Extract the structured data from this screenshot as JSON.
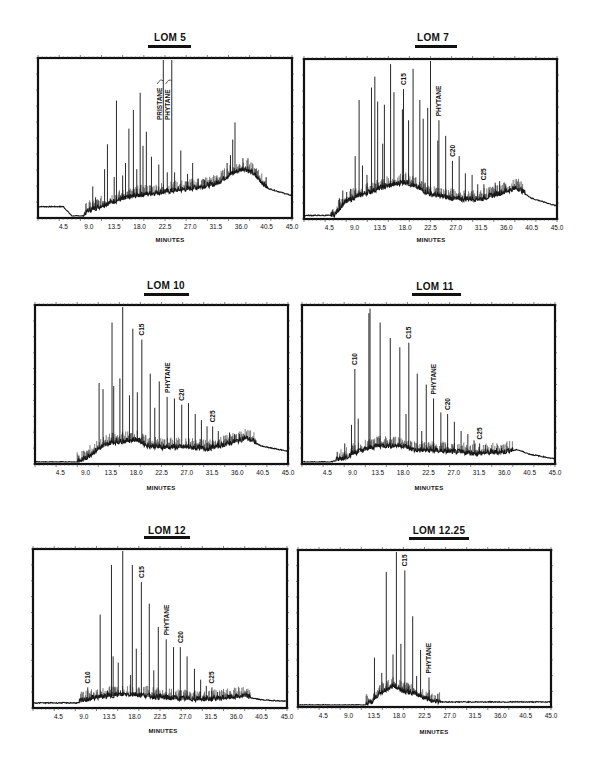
{
  "chart_data": [
    {
      "type": "line",
      "title": "LOM 5",
      "xlabel": "MINUTES",
      "ylabel": "",
      "xlim": [
        0,
        45.0
      ],
      "x_ticks": [
        "4.5",
        "9.0",
        "13.5",
        "18.0",
        "22.5",
        "27.0",
        "31.5",
        "36.0",
        "40.5",
        "45.0"
      ],
      "annotations": [
        "PRISTANE",
        "PHYTANE"
      ],
      "baseline": [
        [
          0,
          0.06
        ],
        [
          4.5,
          0.06
        ],
        [
          6,
          0.0
        ],
        [
          8,
          0.0
        ],
        [
          9,
          0.03
        ],
        [
          13.5,
          0.09
        ],
        [
          18,
          0.13
        ],
        [
          22.5,
          0.15
        ],
        [
          27,
          0.17
        ],
        [
          31.5,
          0.2
        ],
        [
          34,
          0.26
        ],
        [
          36.5,
          0.3
        ],
        [
          38,
          0.27
        ],
        [
          40.5,
          0.18
        ],
        [
          45,
          0.13
        ]
      ],
      "peaks": [
        {
          "x": 9.7,
          "h": 0.19
        },
        {
          "x": 10.2,
          "h": 0.12
        },
        {
          "x": 11.8,
          "h": 0.3
        },
        {
          "x": 12.3,
          "h": 0.46
        },
        {
          "x": 13.5,
          "h": 0.25
        },
        {
          "x": 13.9,
          "h": 0.74
        },
        {
          "x": 15.0,
          "h": 0.26
        },
        {
          "x": 15.5,
          "h": 0.34
        },
        {
          "x": 16.1,
          "h": 0.56
        },
        {
          "x": 16.9,
          "h": 0.68
        },
        {
          "x": 17.5,
          "h": 0.3
        },
        {
          "x": 18.1,
          "h": 0.79
        },
        {
          "x": 18.6,
          "h": 0.45
        },
        {
          "x": 19.2,
          "h": 0.54
        },
        {
          "x": 20.1,
          "h": 0.38
        },
        {
          "x": 21.4,
          "h": 0.33
        },
        {
          "x": 22.2,
          "h": 1.0,
          "label": "PRISTANE"
        },
        {
          "x": 22.9,
          "h": 0.28
        },
        {
          "x": 23.7,
          "h": 1.0,
          "label": "PHYTANE"
        },
        {
          "x": 24.2,
          "h": 0.28
        },
        {
          "x": 25.3,
          "h": 0.42
        },
        {
          "x": 26.5,
          "h": 0.27
        },
        {
          "x": 27.4,
          "h": 0.34
        },
        {
          "x": 28.4,
          "h": 0.24
        },
        {
          "x": 29.5,
          "h": 0.23
        },
        {
          "x": 30.5,
          "h": 0.23
        },
        {
          "x": 31.7,
          "h": 0.26
        },
        {
          "x": 33.5,
          "h": 0.34
        },
        {
          "x": 34.1,
          "h": 0.39
        },
        {
          "x": 34.5,
          "h": 0.49
        },
        {
          "x": 34.9,
          "h": 0.6
        },
        {
          "x": 36.3,
          "h": 0.37
        },
        {
          "x": 37.2,
          "h": 0.37
        },
        {
          "x": 38.6,
          "h": 0.3
        }
      ]
    },
    {
      "type": "line",
      "title": "LOM 7",
      "xlabel": "MINUTES",
      "ylabel": "",
      "xlim": [
        0,
        45.0
      ],
      "x_ticks": [
        "4.5",
        "9.0",
        "13.5",
        "18.0",
        "22.5",
        "27.0",
        "31.5",
        "36.0",
        "40.5",
        "45.0"
      ],
      "annotations": [
        "C15",
        "PHYTANE",
        "C20",
        "C25"
      ],
      "baseline": [
        [
          0,
          0.01
        ],
        [
          5.5,
          0.01
        ],
        [
          7,
          0.08
        ],
        [
          9,
          0.12
        ],
        [
          13.5,
          0.18
        ],
        [
          18,
          0.22
        ],
        [
          22.5,
          0.14
        ],
        [
          27,
          0.11
        ],
        [
          31.5,
          0.11
        ],
        [
          36,
          0.16
        ],
        [
          38,
          0.18
        ],
        [
          40.5,
          0.12
        ],
        [
          45,
          0.07
        ]
      ],
      "peaks": [
        {
          "x": 6.3,
          "h": 0.12
        },
        {
          "x": 6.9,
          "h": 0.17
        },
        {
          "x": 7.6,
          "h": 0.16
        },
        {
          "x": 8.3,
          "h": 0.18
        },
        {
          "x": 9.1,
          "h": 0.39
        },
        {
          "x": 9.8,
          "h": 0.75
        },
        {
          "x": 10.4,
          "h": 0.33
        },
        {
          "x": 11.2,
          "h": 0.27
        },
        {
          "x": 12.0,
          "h": 0.83
        },
        {
          "x": 12.6,
          "h": 0.9
        },
        {
          "x": 13.1,
          "h": 0.74
        },
        {
          "x": 14.0,
          "h": 0.47
        },
        {
          "x": 14.3,
          "h": 0.72
        },
        {
          "x": 15.4,
          "h": 0.98
        },
        {
          "x": 16.0,
          "h": 0.8
        },
        {
          "x": 17.5,
          "h": 0.69
        },
        {
          "x": 17.7,
          "h": 0.82,
          "label": "C15"
        },
        {
          "x": 18.6,
          "h": 0.62
        },
        {
          "x": 19.4,
          "h": 0.95
        },
        {
          "x": 20.6,
          "h": 0.75
        },
        {
          "x": 21.2,
          "h": 0.63
        },
        {
          "x": 22.0,
          "h": 0.7
        },
        {
          "x": 22.5,
          "h": 1.0
        },
        {
          "x": 23.8,
          "h": 0.49
        },
        {
          "x": 24.0,
          "h": 0.62,
          "label": "PHYTANE"
        },
        {
          "x": 25.2,
          "h": 0.52
        },
        {
          "x": 26.4,
          "h": 0.36,
          "label": "C20"
        },
        {
          "x": 27.6,
          "h": 0.39
        },
        {
          "x": 28.7,
          "h": 0.28
        },
        {
          "x": 29.9,
          "h": 0.27
        },
        {
          "x": 30.9,
          "h": 0.21
        },
        {
          "x": 32.0,
          "h": 0.21,
          "label": "C25"
        },
        {
          "x": 32.9,
          "h": 0.19
        },
        {
          "x": 34.0,
          "h": 0.22
        },
        {
          "x": 34.8,
          "h": 0.23
        },
        {
          "x": 35.9,
          "h": 0.2
        },
        {
          "x": 36.6,
          "h": 0.2
        },
        {
          "x": 37.3,
          "h": 0.2
        }
      ]
    },
    {
      "type": "line",
      "title": "LOM 10",
      "xlabel": "MINUTES",
      "ylabel": "",
      "xlim": [
        0,
        45.0
      ],
      "x_ticks": [
        "4.5",
        "9.0",
        "13.5",
        "18.0",
        "22.5",
        "27.0",
        "31.5",
        "36.0",
        "40.5",
        "45.0"
      ],
      "annotations": [
        "C15",
        "PHYTANE",
        "C20",
        "C25"
      ],
      "baseline": [
        [
          0,
          0.0
        ],
        [
          8,
          0.0
        ],
        [
          9,
          0.02
        ],
        [
          11.3,
          0.08
        ],
        [
          13.5,
          0.12
        ],
        [
          16,
          0.13
        ],
        [
          18,
          0.14
        ],
        [
          20,
          0.1
        ],
        [
          22.5,
          0.09
        ],
        [
          27,
          0.09
        ],
        [
          30.5,
          0.08
        ],
        [
          33,
          0.1
        ],
        [
          36,
          0.13
        ],
        [
          37.5,
          0.15
        ],
        [
          40.5,
          0.1
        ],
        [
          45,
          0.07
        ]
      ],
      "peaks": [
        {
          "x": 9.0,
          "h": 0.04
        },
        {
          "x": 9.5,
          "h": 0.05
        },
        {
          "x": 10.0,
          "h": 0.06
        },
        {
          "x": 10.8,
          "h": 0.07
        },
        {
          "x": 11.4,
          "h": 0.51
        },
        {
          "x": 12.1,
          "h": 0.47
        },
        {
          "x": 13.7,
          "h": 0.9
        },
        {
          "x": 14.0,
          "h": 0.49
        },
        {
          "x": 15.1,
          "h": 0.54
        },
        {
          "x": 15.6,
          "h": 1.0
        },
        {
          "x": 16.8,
          "h": 0.43
        },
        {
          "x": 17.4,
          "h": 0.86
        },
        {
          "x": 18.2,
          "h": 0.45
        },
        {
          "x": 19.0,
          "h": 0.79,
          "label": "C15"
        },
        {
          "x": 20.5,
          "h": 0.57
        },
        {
          "x": 21.3,
          "h": 0.35
        },
        {
          "x": 22.1,
          "h": 0.52
        },
        {
          "x": 23.5,
          "h": 0.42,
          "label": "PHYTANE"
        },
        {
          "x": 24.8,
          "h": 0.41
        },
        {
          "x": 26.1,
          "h": 0.37,
          "label": "C20"
        },
        {
          "x": 27.3,
          "h": 0.38
        },
        {
          "x": 28.5,
          "h": 0.31
        },
        {
          "x": 29.6,
          "h": 0.27
        },
        {
          "x": 30.6,
          "h": 0.23
        },
        {
          "x": 31.6,
          "h": 0.23,
          "label": "C25"
        },
        {
          "x": 32.6,
          "h": 0.2
        },
        {
          "x": 33.6,
          "h": 0.17
        },
        {
          "x": 34.6,
          "h": 0.19
        },
        {
          "x": 35.5,
          "h": 0.18
        },
        {
          "x": 36.4,
          "h": 0.18
        },
        {
          "x": 37.3,
          "h": 0.17
        }
      ]
    },
    {
      "type": "line",
      "title": "LOM 11",
      "xlabel": "MINUTES",
      "ylabel": "",
      "xlim": [
        0,
        45.0
      ],
      "x_ticks": [
        "4.5",
        "9.0",
        "13.5",
        "18.0",
        "22.5",
        "27.0",
        "31.5",
        "36.0",
        "40.5",
        "45.0"
      ],
      "annotations": [
        "C10",
        "PHYTANE",
        "C20",
        "C25"
      ],
      "labels_extra": [
        "C15"
      ],
      "baseline": [
        [
          0,
          0.0
        ],
        [
          5,
          0.0
        ],
        [
          7.5,
          0.02
        ],
        [
          9,
          0.05
        ],
        [
          13.5,
          0.1
        ],
        [
          18,
          0.1
        ],
        [
          20,
          0.07
        ],
        [
          22.5,
          0.07
        ],
        [
          27,
          0.06
        ],
        [
          31.5,
          0.05
        ],
        [
          36,
          0.06
        ],
        [
          38.3,
          0.08
        ],
        [
          40.5,
          0.05
        ],
        [
          45,
          0.02
        ]
      ],
      "peaks": [
        {
          "x": 7.6,
          "h": 0.12
        },
        {
          "x": 8.8,
          "h": 0.24
        },
        {
          "x": 9.4,
          "h": 0.6,
          "label": "C10"
        },
        {
          "x": 10.0,
          "h": 0.28
        },
        {
          "x": 11.9,
          "h": 0.96
        },
        {
          "x": 12.1,
          "h": 0.99
        },
        {
          "x": 13.9,
          "h": 0.9
        },
        {
          "x": 15.7,
          "h": 0.8
        },
        {
          "x": 17.4,
          "h": 0.74
        },
        {
          "x": 19.0,
          "h": 0.77,
          "label": "C15"
        },
        {
          "x": 18.5,
          "h": 0.31
        },
        {
          "x": 20.5,
          "h": 0.57
        },
        {
          "x": 21.3,
          "h": 0.2
        },
        {
          "x": 22.1,
          "h": 0.5
        },
        {
          "x": 23.4,
          "h": 0.41,
          "label": "PHYTANE"
        },
        {
          "x": 24.7,
          "h": 0.32
        },
        {
          "x": 25.9,
          "h": 0.31,
          "label": "C20"
        },
        {
          "x": 27.1,
          "h": 0.26
        },
        {
          "x": 28.3,
          "h": 0.2
        },
        {
          "x": 29.5,
          "h": 0.18
        },
        {
          "x": 30.6,
          "h": 0.14
        },
        {
          "x": 31.6,
          "h": 0.12,
          "label": "C25"
        },
        {
          "x": 32.6,
          "h": 0.11
        },
        {
          "x": 33.6,
          "h": 0.09
        },
        {
          "x": 34.6,
          "h": 0.09
        },
        {
          "x": 35.5,
          "h": 0.09
        }
      ]
    },
    {
      "type": "line",
      "title": "LOM 12",
      "xlabel": "MINUTES",
      "ylabel": "",
      "xlim": [
        0,
        45.0
      ],
      "x_ticks": [
        "4.5",
        "9.0",
        "13.5",
        "18.0",
        "22.5",
        "27.0",
        "31.5",
        "36.0",
        "40.5",
        "45.0"
      ],
      "annotations": [
        "C10",
        "C15",
        "PHYTANE",
        "C20",
        "C25"
      ],
      "baseline": [
        [
          0,
          0.02
        ],
        [
          4.5,
          0.02
        ],
        [
          8,
          0.02
        ],
        [
          9,
          0.03
        ],
        [
          11,
          0.05
        ],
        [
          13.5,
          0.06
        ],
        [
          16,
          0.07
        ],
        [
          18,
          0.07
        ],
        [
          22.5,
          0.05
        ],
        [
          27,
          0.04
        ],
        [
          31.5,
          0.04
        ],
        [
          35,
          0.05
        ],
        [
          37.5,
          0.06
        ],
        [
          40.5,
          0.04
        ],
        [
          45,
          0.03
        ]
      ],
      "peaks": [
        {
          "x": 9.7,
          "h": 0.12,
          "label": "C10"
        },
        {
          "x": 10.3,
          "h": 0.05
        },
        {
          "x": 11.2,
          "h": 0.06
        },
        {
          "x": 11.9,
          "h": 0.59
        },
        {
          "x": 13.2,
          "h": 0.1
        },
        {
          "x": 13.9,
          "h": 0.91
        },
        {
          "x": 14.2,
          "h": 0.32
        },
        {
          "x": 15.1,
          "h": 0.28
        },
        {
          "x": 15.9,
          "h": 1.0
        },
        {
          "x": 17.3,
          "h": 0.2
        },
        {
          "x": 17.6,
          "h": 0.91
        },
        {
          "x": 18.3,
          "h": 0.37
        },
        {
          "x": 19.2,
          "h": 0.8,
          "label": "C15"
        },
        {
          "x": 20.6,
          "h": 0.66
        },
        {
          "x": 21.4,
          "h": 0.23
        },
        {
          "x": 22.2,
          "h": 0.51
        },
        {
          "x": 23.6,
          "h": 0.43,
          "label": "PHYTANE"
        },
        {
          "x": 24.9,
          "h": 0.38
        },
        {
          "x": 26.1,
          "h": 0.38,
          "label": "C20"
        },
        {
          "x": 27.3,
          "h": 0.32
        },
        {
          "x": 28.6,
          "h": 0.24
        },
        {
          "x": 29.7,
          "h": 0.17
        },
        {
          "x": 30.7,
          "h": 0.13
        },
        {
          "x": 31.7,
          "h": 0.12,
          "label": "C25"
        },
        {
          "x": 32.7,
          "h": 0.09
        },
        {
          "x": 33.7,
          "h": 0.07
        },
        {
          "x": 34.7,
          "h": 0.07
        },
        {
          "x": 35.6,
          "h": 0.06
        },
        {
          "x": 36.5,
          "h": 0.06
        }
      ]
    },
    {
      "type": "line",
      "title": "LOM 12.25",
      "xlabel": "MINUTES",
      "ylabel": "",
      "xlim": [
        0,
        45.0
      ],
      "x_ticks": [
        "4.5",
        "9.0",
        "13.5",
        "18.0",
        "22.5",
        "27.0",
        "31.5",
        "36.0",
        "40.5",
        "45.0"
      ],
      "annotations": [
        "C15",
        "PHYTANE"
      ],
      "baseline": [
        [
          0,
          0.0
        ],
        [
          12,
          0.0
        ],
        [
          13.3,
          0.02
        ],
        [
          14.5,
          0.07
        ],
        [
          16,
          0.1
        ],
        [
          17,
          0.12
        ],
        [
          18.5,
          0.09
        ],
        [
          20.5,
          0.07
        ],
        [
          22,
          0.05
        ],
        [
          23.4,
          0.03
        ],
        [
          24,
          0.02
        ],
        [
          45,
          0.02
        ]
      ],
      "peaks": [
        {
          "x": 13.6,
          "h": 0.31
        },
        {
          "x": 14.9,
          "h": 0.21
        },
        {
          "x": 15.7,
          "h": 0.87
        },
        {
          "x": 16.9,
          "h": 0.33
        },
        {
          "x": 17.5,
          "h": 1.0
        },
        {
          "x": 18.3,
          "h": 0.4
        },
        {
          "x": 19.0,
          "h": 0.88,
          "label": "C15"
        },
        {
          "x": 19.6,
          "h": 0.12
        },
        {
          "x": 20.4,
          "h": 0.58
        },
        {
          "x": 21.1,
          "h": 0.19
        },
        {
          "x": 21.8,
          "h": 0.36
        },
        {
          "x": 23.3,
          "h": 0.18,
          "label": "PHYTANE"
        }
      ]
    }
  ],
  "panels": [
    {
      "title": "LOM 5",
      "xlabel": "MINUTES"
    },
    {
      "title": "LOM 7",
      "xlabel": "MINUTES"
    },
    {
      "title": "LOM 10",
      "xlabel": "MINUTES"
    },
    {
      "title": "LOM 11",
      "xlabel": "MINUTES"
    },
    {
      "title": "LOM 12",
      "xlabel": "MINUTES"
    },
    {
      "title": "LOM 12.25",
      "xlabel": "MINUTES"
    }
  ]
}
